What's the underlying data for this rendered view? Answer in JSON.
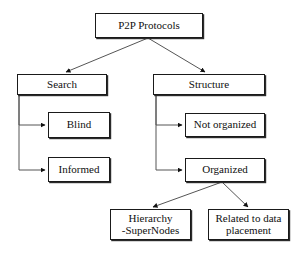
{
  "diagram": {
    "type": "tree-hierarchy",
    "background_color": "#ffffff",
    "line_color": "#555555",
    "box_border_color": "#1a1a1a",
    "text_color": "#101010",
    "nodes": [
      {
        "id": "root",
        "label": "P2P Protocols"
      },
      {
        "id": "search",
        "label": "Search"
      },
      {
        "id": "structure",
        "label": "Structure"
      },
      {
        "id": "blind",
        "label": "Blind"
      },
      {
        "id": "notorg",
        "label": "Not organized"
      },
      {
        "id": "informed",
        "label": "Informed"
      },
      {
        "id": "organized",
        "label": "Organized"
      },
      {
        "id": "hierarchy",
        "label": "Hierarchy\n-SuperNodes"
      },
      {
        "id": "related",
        "label": "Related to data\nplacement"
      }
    ],
    "edges": [
      {
        "from": "root",
        "to": "search"
      },
      {
        "from": "root",
        "to": "structure"
      },
      {
        "from": "search",
        "to": "blind"
      },
      {
        "from": "search",
        "to": "informed"
      },
      {
        "from": "structure",
        "to": "notorg"
      },
      {
        "from": "structure",
        "to": "organized"
      },
      {
        "from": "organized",
        "to": "hierarchy"
      },
      {
        "from": "organized",
        "to": "related"
      }
    ]
  }
}
